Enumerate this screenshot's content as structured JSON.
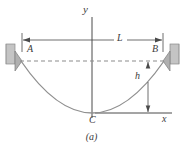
{
  "figure": {
    "caption": "(a)",
    "type": "engineering-diagram",
    "labels": {
      "y_axis": "y",
      "x_axis": "x",
      "span": "L",
      "sag": "h",
      "left_support": "A",
      "right_support": "B",
      "lowest_point": "C"
    },
    "colors": {
      "line": "#3b3b3b",
      "curve": "#7a7a7a",
      "dashed": "#8c8c8c",
      "wall_fill": "#c9c9c9",
      "wall_edge": "#8a8a8a",
      "bracket_fill": "#b3b3b3",
      "background": "#ffffff"
    },
    "geometry": {
      "left_support_x": 20,
      "right_support_x": 165,
      "chord_y": 61,
      "vertex_x": 92,
      "vertex_y": 113,
      "y_axis_x": 92,
      "x_axis_y": 113,
      "dimension_line_y": 40,
      "sag_line_x": 148
    }
  }
}
